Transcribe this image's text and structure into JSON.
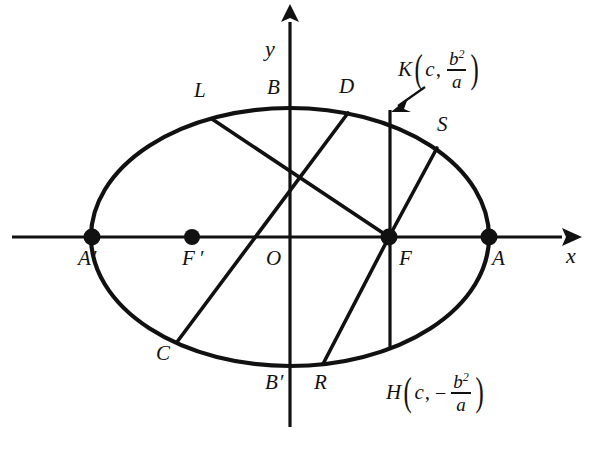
{
  "figure": {
    "type": "geometry-diagram",
    "background_color": "#ffffff",
    "ink_color": "#111111"
  },
  "axes": {
    "x_label": "x",
    "y_label": "y",
    "origin_label": "O"
  },
  "ellipse": {
    "center": {
      "x": 290,
      "y": 237
    },
    "semi_major_a": 199,
    "semi_minor_b": 129
  },
  "points": [
    {
      "id": "A",
      "label": "A",
      "marker": true,
      "x": 489,
      "y": 237,
      "label_x": 492,
      "label_y": 253
    },
    {
      "id": "Ap",
      "label": "A",
      "prime": "′",
      "marker": true,
      "x": 92,
      "y": 237,
      "label_x": 79,
      "label_y": 253
    },
    {
      "id": "F",
      "label": "F",
      "marker": true,
      "x": 389,
      "y": 237,
      "label_x": 398,
      "label_y": 253
    },
    {
      "id": "Fp",
      "label": "F",
      "prime": "′",
      "marker": true,
      "x": 192,
      "y": 237,
      "label_x": 183,
      "label_y": 253
    },
    {
      "id": "B",
      "label": "B",
      "marker": false,
      "x": 290,
      "y": 108,
      "label_x": 268,
      "label_y": 82
    },
    {
      "id": "Bp",
      "label": "B",
      "prime": "′",
      "marker": false,
      "x": 290,
      "y": 366,
      "label_x": 268,
      "label_y": 376
    },
    {
      "id": "L",
      "label": "L",
      "marker": false,
      "x": 212,
      "y": 119,
      "label_x": 196,
      "label_y": 86
    },
    {
      "id": "D",
      "label": "D",
      "marker": false,
      "x": 348,
      "y": 113,
      "label_x": 340,
      "label_y": 80
    },
    {
      "id": "S",
      "label": "S",
      "marker": false,
      "x": 437,
      "y": 148,
      "label_x": 438,
      "label_y": 119
    },
    {
      "id": "C",
      "label": "C",
      "marker": false,
      "x": 177,
      "y": 342,
      "label_x": 158,
      "label_y": 348
    },
    {
      "id": "R",
      "label": "R",
      "marker": false,
      "x": 323,
      "y": 364,
      "label_x": 316,
      "label_y": 376
    }
  ],
  "coord_labels": {
    "K": {
      "name": "K",
      "open_paren": "(",
      "x_coord": "c",
      "comma": ",",
      "sign": "",
      "numerator": "b",
      "numerator_exp": "2",
      "denominator": "a",
      "close_paren": ")",
      "pos_x": 398,
      "pos_y": 48
    },
    "H": {
      "name": "H",
      "open_paren": "(",
      "x_coord": "c",
      "comma": ",",
      "sign": "−",
      "numerator": "b",
      "numerator_exp": "2",
      "denominator": "a",
      "close_paren": ")",
      "pos_x": 386,
      "pos_y": 371
    }
  },
  "chords": [
    {
      "id": "L-F",
      "from": "L",
      "to": "F",
      "x1": 212,
      "y1": 119,
      "x2": 389,
      "y2": 237
    },
    {
      "id": "D-C",
      "from": "D",
      "to": "C",
      "x1": 348,
      "y1": 113,
      "x2": 177,
      "y2": 342
    },
    {
      "id": "S-F",
      "from": "S",
      "to": "F",
      "x1": 437,
      "y1": 148,
      "x2": 389,
      "y2": 237
    },
    {
      "id": "R-F",
      "from": "R",
      "to": "F",
      "x1": 323,
      "y1": 364,
      "x2": 389,
      "y2": 237
    },
    {
      "id": "K-H",
      "from": "K",
      "to": "H",
      "x1": 390,
      "y1": 112,
      "x2": 390,
      "y2": 348
    }
  ],
  "pointer": {
    "target": "K",
    "tail_x": 425,
    "tail_y": 87,
    "tip_x": 392,
    "tip_y": 111
  }
}
